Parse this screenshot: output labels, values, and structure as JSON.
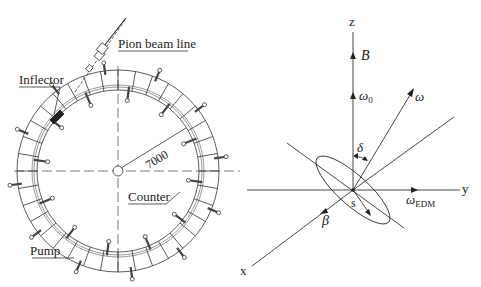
{
  "left_figure": {
    "labels": {
      "pion_beam_line": "Pion beam line",
      "inflector": "Inflector",
      "radius": "7000",
      "counter": "Counter",
      "pump": "Pump"
    },
    "ring": {
      "cx": 118,
      "cy": 171,
      "outer_r": 101,
      "inner_r": 81,
      "segments": 36
    }
  },
  "right_figure": {
    "axes": {
      "z": "z",
      "y": "y",
      "x": "x"
    },
    "vectors": {
      "B": "B",
      "omega0": "ω",
      "omega0_sub": "0",
      "omega": "ω",
      "omega_edm": "ω",
      "omega_edm_sub": "EDM",
      "beta": "β",
      "delta": "δ",
      "spin": "s"
    }
  },
  "colors": {
    "line": "#333333",
    "text": "#222222",
    "background": "#ffffff"
  }
}
